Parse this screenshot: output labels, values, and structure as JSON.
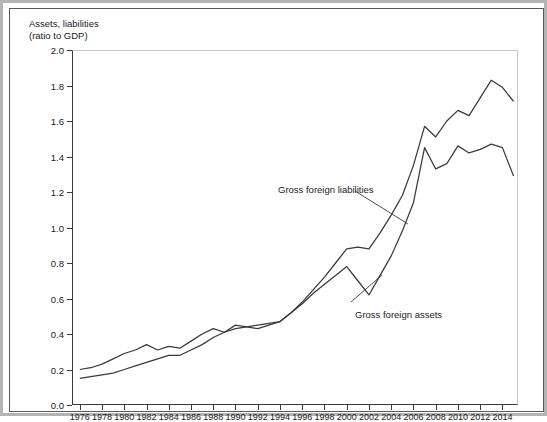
{
  "chart_data": {
    "type": "line",
    "title_line1": "Assets, liabilities",
    "title_line2": "(ratio to GDP)",
    "xlabel": "",
    "ylabel": "",
    "xlim": [
      1975.3,
      2015.4
    ],
    "ylim": [
      0.0,
      2.0
    ],
    "grid": false,
    "legend": "inline-annotations",
    "yticks": [
      "0.0",
      "0.2",
      "0.4",
      "0.6",
      "0.8",
      "1.0",
      "1.2",
      "1.4",
      "1.6",
      "1.8",
      "2.0"
    ],
    "ytick_values": [
      0.0,
      0.2,
      0.4,
      0.6,
      0.8,
      1.0,
      1.2,
      1.4,
      1.6,
      1.8,
      2.0
    ],
    "xticks": [
      "1976",
      "1978",
      "1980",
      "1982",
      "1984",
      "1986",
      "1988",
      "1990",
      "1992",
      "1994",
      "1996",
      "1998",
      "2000",
      "2002",
      "2004",
      "2006",
      "2008",
      "2010",
      "2012",
      "2014"
    ],
    "xtick_values": [
      1976,
      1978,
      1980,
      1982,
      1984,
      1986,
      1988,
      1990,
      1992,
      1994,
      1996,
      1998,
      2000,
      2002,
      2004,
      2006,
      2008,
      2010,
      2012,
      2014
    ],
    "x": [
      1976,
      1977,
      1978,
      1979,
      1980,
      1981,
      1982,
      1983,
      1984,
      1985,
      1986,
      1987,
      1988,
      1989,
      1990,
      1991,
      1992,
      1993,
      1994,
      1995,
      1996,
      1997,
      1998,
      1999,
      2000,
      2001,
      2002,
      2003,
      2004,
      2005,
      2006,
      2007,
      2008,
      2009,
      2010,
      2011,
      2012,
      2013,
      2014,
      2015
    ],
    "series": [
      {
        "name": "Gross foreign liabilities",
        "color": "#3a3a3a",
        "values": [
          0.2,
          0.21,
          0.23,
          0.26,
          0.29,
          0.31,
          0.34,
          0.31,
          0.33,
          0.32,
          0.36,
          0.4,
          0.43,
          0.41,
          0.45,
          0.44,
          0.43,
          0.45,
          0.47,
          0.52,
          0.58,
          0.65,
          0.72,
          0.8,
          0.88,
          0.89,
          0.88,
          0.97,
          1.07,
          1.18,
          1.35,
          1.57,
          1.51,
          1.6,
          1.66,
          1.63,
          1.73,
          1.83,
          1.79,
          1.71
        ]
      },
      {
        "name": "Gross foreign assets",
        "color": "#3a3a3a",
        "values": [
          0.15,
          0.16,
          0.17,
          0.18,
          0.2,
          0.22,
          0.24,
          0.26,
          0.28,
          0.28,
          0.31,
          0.34,
          0.38,
          0.41,
          0.43,
          0.44,
          0.45,
          0.46,
          0.47,
          0.52,
          0.57,
          0.63,
          0.68,
          0.73,
          0.78,
          0.7,
          0.62,
          0.73,
          0.84,
          0.98,
          1.14,
          1.45,
          1.33,
          1.36,
          1.46,
          1.42,
          1.44,
          1.47,
          1.45,
          1.29
        ]
      }
    ],
    "annotations": [
      {
        "text": "Gross foreign liabilities",
        "label_x": 268,
        "label_y": 175,
        "leader_from": [
          345,
          182
        ],
        "leader_to": [
          398,
          215
        ]
      },
      {
        "text": "Gross foreign assets",
        "label_x": 345,
        "label_y": 300,
        "leader_from": [
          341,
          293
        ],
        "leader_to": [
          372,
          266
        ]
      }
    ]
  }
}
